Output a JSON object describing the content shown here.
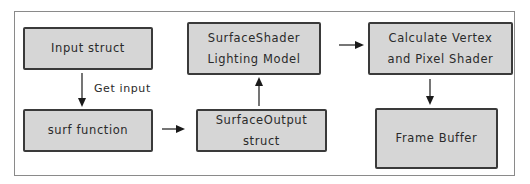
{
  "diagram": {
    "nodes": [
      {
        "id": "input_struct",
        "lines": [
          "Input struct"
        ]
      },
      {
        "id": "surf_function",
        "lines": [
          "surf function"
        ]
      },
      {
        "id": "surface_output",
        "lines": [
          "SurfaceOutput",
          "struct"
        ]
      },
      {
        "id": "surface_shader",
        "lines": [
          "SurfaceShader",
          "Lighting Model"
        ]
      },
      {
        "id": "calculate",
        "lines": [
          "Calculate Vertex",
          "and Pixel Shader"
        ]
      },
      {
        "id": "frame_buffer",
        "lines": [
          "Frame Buffer"
        ]
      }
    ],
    "edges": [
      {
        "from": "input_struct",
        "to": "surf_function",
        "label": "Get input"
      },
      {
        "from": "surf_function",
        "to": "surface_output",
        "label": ""
      },
      {
        "from": "surface_output",
        "to": "surface_shader",
        "label": ""
      },
      {
        "from": "surface_shader",
        "to": "calculate",
        "label": ""
      },
      {
        "from": "calculate",
        "to": "frame_buffer",
        "label": ""
      }
    ],
    "colors": {
      "box_fill": "#d6d6d6",
      "box_border": "#3a3a3a",
      "arrow": "#1a1a1a",
      "frame": "#8a8a8a"
    }
  }
}
